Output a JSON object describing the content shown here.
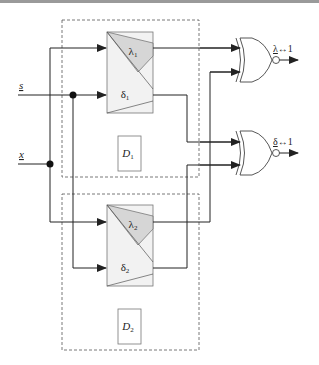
{
  "diagram": {
    "inputs": [
      {
        "id": "s",
        "label": "s",
        "underlined": true
      },
      {
        "id": "x",
        "label": "x",
        "underlined": true
      }
    ],
    "blocks": [
      {
        "id": "block1",
        "lambda_label": "λ",
        "lambda_sub": "1",
        "delta_label": "δ",
        "delta_sub": "1",
        "detector_label": "D",
        "detector_sub": "1"
      },
      {
        "id": "block2",
        "lambda_label": "λ",
        "lambda_sub": "2",
        "delta_label": "δ",
        "delta_sub": "2",
        "detector_label": "D",
        "detector_sub": "2"
      }
    ],
    "gates": [
      {
        "id": "xnor-lambda",
        "type": "XNOR",
        "output_var": "λ",
        "output_rest": "↔1"
      },
      {
        "id": "xnor-delta",
        "type": "XNOR",
        "output_var": "δ",
        "output_rest": "↔1"
      }
    ],
    "colors": {
      "line": "#222222",
      "block_fill": "#f2f2f2",
      "lambda_fill": "#d6d6d6",
      "dashed": "#555555",
      "top_bar": "#9a9a9a"
    }
  }
}
